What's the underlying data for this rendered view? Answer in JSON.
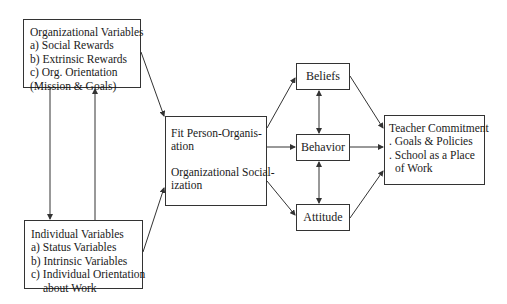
{
  "diagram": {
    "nodes": {
      "organizational_variables": {
        "title": "Organizational Variables",
        "items": [
          "a) Social Rewards",
          "b) Extrinsic Rewards",
          "c) Org. Orientation",
          "(Mission & Goals)"
        ]
      },
      "individual_variables": {
        "title": "Individual Variables",
        "items": [
          "a) Status Variables",
          "b) Intrinsic Variables",
          "c) Individual Orientation",
          "about Work"
        ]
      },
      "fit": {
        "lines1": [
          "Fit Person-Organis-",
          "ation"
        ],
        "lines2": [
          "Organizational Social-",
          "ization"
        ]
      },
      "beliefs": {
        "label": "Beliefs"
      },
      "behavior": {
        "label": "Behavior"
      },
      "attitude": {
        "label": "Attitude"
      },
      "teacher_commitment": {
        "title": "Teacher Commitment",
        "items": [
          ". Goals & Policies",
          ". School as a Place",
          "of Work"
        ]
      }
    },
    "edges": [
      {
        "from": "organizational_variables",
        "to": "individual_variables"
      },
      {
        "from": "individual_variables",
        "to": "organizational_variables"
      },
      {
        "from": "organizational_variables",
        "to": "fit"
      },
      {
        "from": "individual_variables",
        "to": "fit"
      },
      {
        "from": "fit",
        "to": "beliefs"
      },
      {
        "from": "fit",
        "to": "behavior"
      },
      {
        "from": "fit",
        "to": "attitude"
      },
      {
        "from": "beliefs",
        "to": "behavior",
        "bidirectional": true
      },
      {
        "from": "behavior",
        "to": "attitude",
        "bidirectional": true
      },
      {
        "from": "beliefs",
        "to": "teacher_commitment"
      },
      {
        "from": "behavior",
        "to": "teacher_commitment"
      },
      {
        "from": "attitude",
        "to": "teacher_commitment"
      }
    ],
    "colors": {
      "line": "#333333",
      "background": "#ffffff"
    }
  }
}
